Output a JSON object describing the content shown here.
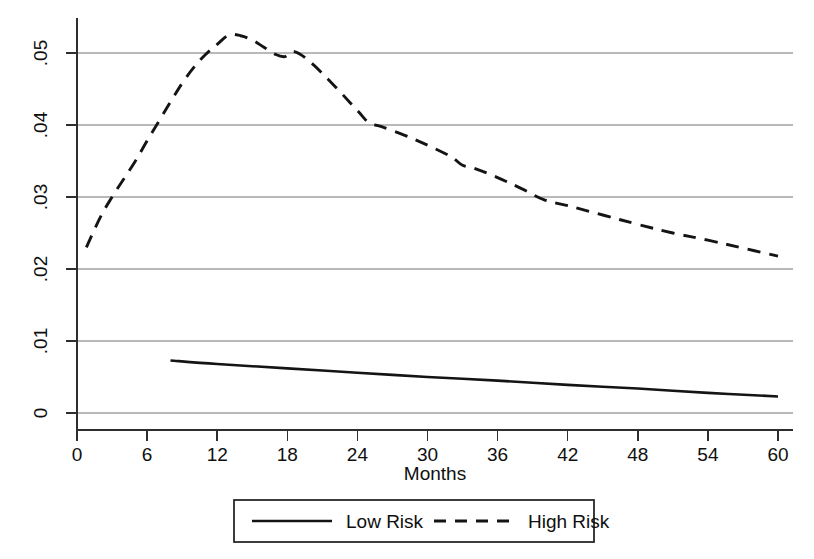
{
  "chart_data": {
    "type": "line",
    "title": "",
    "subtitle": "",
    "xlabel": "Months",
    "ylabel": "",
    "xlim": [
      0,
      60
    ],
    "ylim": [
      0,
      0.055
    ],
    "xticks": [
      0,
      6,
      12,
      18,
      24,
      30,
      36,
      42,
      48,
      54,
      60
    ],
    "xtick_labels": [
      "0",
      "6",
      "12",
      "18",
      "24",
      "30",
      "36",
      "42",
      "48",
      "54",
      "60"
    ],
    "yticks": [
      0,
      0.01,
      0.02,
      0.03,
      0.04,
      0.05
    ],
    "ytick_labels": [
      "0",
      ".01",
      ".02",
      ".03",
      ".04",
      ".05"
    ],
    "grid": "horizontal",
    "legend_position": "below-axes",
    "series": [
      {
        "name": "Low Risk",
        "style": "solid",
        "color": "#141414",
        "x": [
          8,
          12,
          18,
          24,
          30,
          36,
          42,
          48,
          54,
          60
        ],
        "values": [
          0.0073,
          0.0068,
          0.0062,
          0.0056,
          0.005,
          0.0045,
          0.0039,
          0.0034,
          0.0028,
          0.0023
        ]
      },
      {
        "name": "High Risk",
        "style": "dashed",
        "color": "#141414",
        "x": [
          0.8,
          2,
          3,
          4,
          5,
          6,
          7,
          8,
          9,
          10,
          11,
          12,
          13,
          14,
          15,
          16,
          17,
          17.8,
          18.6,
          20,
          22,
          24,
          25,
          26,
          28,
          30,
          32,
          33,
          34,
          36,
          38,
          40,
          42,
          45,
          48,
          51,
          54,
          57,
          60
        ],
        "values": [
          0.023,
          0.0272,
          0.03,
          0.0325,
          0.035,
          0.0378,
          0.0405,
          0.0432,
          0.0458,
          0.048,
          0.0498,
          0.0512,
          0.0525,
          0.0524,
          0.0518,
          0.0508,
          0.0498,
          0.0495,
          0.0502,
          0.0487,
          0.0455,
          0.042,
          0.0403,
          0.0398,
          0.0386,
          0.0372,
          0.0356,
          0.0344,
          0.034,
          0.0327,
          0.0312,
          0.0296,
          0.0288,
          0.0275,
          0.0262,
          0.025,
          0.024,
          0.0229,
          0.0218
        ]
      }
    ]
  },
  "axes": {
    "x_axis_title": "Months",
    "x_tick_labels": [
      "0",
      "6",
      "12",
      "18",
      "24",
      "30",
      "36",
      "42",
      "48",
      "54",
      "60"
    ],
    "y_tick_labels": [
      "0",
      ".01",
      ".02",
      ".03",
      ".04",
      ".05"
    ]
  },
  "legend": {
    "items": [
      {
        "label": "Low Risk",
        "style": "solid"
      },
      {
        "label": "High Risk",
        "style": "dashed"
      }
    ]
  }
}
